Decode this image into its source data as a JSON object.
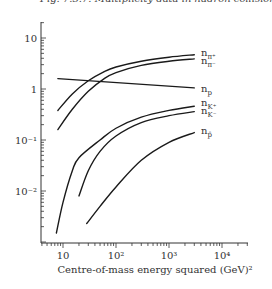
{
  "caption": "Fig. 7.3.7. Multiplicity data in hadron collisions",
  "chart_data": {
    "type": "line",
    "title": "",
    "xlabel": "Centre-of-mass energy squared (GeV)²",
    "ylabel": "",
    "xscale": "log",
    "yscale": "log",
    "xlim": [
      6,
      30000
    ],
    "ylim": [
      0.0012,
      30
    ],
    "grid": false,
    "x_tick_labels": [
      "10",
      "10²",
      "10³",
      "10⁴"
    ],
    "x_ticks": [
      10,
      100,
      1000,
      10000
    ],
    "y_tick_labels": [
      "10",
      "1",
      "10⁻¹",
      "10⁻²"
    ],
    "y_ticks": [
      10,
      1,
      0.1,
      0.01
    ],
    "legend_position": "inline-right",
    "series": [
      {
        "name": "n_π+",
        "label": "nπ+",
        "x": [
          8,
          15,
          30,
          60,
          100,
          300,
          1000,
          3000
        ],
        "y": [
          0.38,
          0.8,
          1.45,
          2.2,
          2.7,
          3.5,
          4.2,
          4.7
        ]
      },
      {
        "name": "n_π-",
        "label": "nπ-",
        "x": [
          8,
          15,
          30,
          60,
          100,
          300,
          1000,
          3000
        ],
        "y": [
          0.16,
          0.4,
          0.9,
          1.6,
          2.1,
          2.9,
          3.5,
          3.9
        ]
      },
      {
        "name": "n_p",
        "label": "np",
        "x": [
          8,
          3000
        ],
        "y": [
          1.6,
          1.05
        ]
      },
      {
        "name": "n_K+",
        "label": "nK+",
        "x": [
          7.5,
          10,
          15,
          20,
          50,
          100,
          300,
          1000,
          3000
        ],
        "y": [
          0.0015,
          0.006,
          0.025,
          0.045,
          0.1,
          0.17,
          0.28,
          0.38,
          0.46
        ]
      },
      {
        "name": "n_K-",
        "label": "nK-",
        "x": [
          20,
          30,
          50,
          100,
          300,
          1000,
          3000
        ],
        "y": [
          0.008,
          0.025,
          0.06,
          0.12,
          0.22,
          0.3,
          0.36
        ]
      },
      {
        "name": "n_p̄",
        "label": "np",
        "x": [
          28,
          50,
          100,
          300,
          1000,
          3000
        ],
        "y": [
          0.0023,
          0.005,
          0.012,
          0.04,
          0.09,
          0.14
        ]
      }
    ]
  },
  "labels": {
    "pi_plus": {
      "main": "n",
      "sub": "π⁺"
    },
    "pi_minus": {
      "main": "n",
      "sub": "π⁻"
    },
    "p": {
      "main": "n",
      "sub": "p"
    },
    "k_plus": {
      "main": "n",
      "sub": "K⁺"
    },
    "k_minus": {
      "main": "n",
      "sub": "K⁻"
    },
    "pbar": {
      "main": "n",
      "sub": "p̄"
    }
  }
}
